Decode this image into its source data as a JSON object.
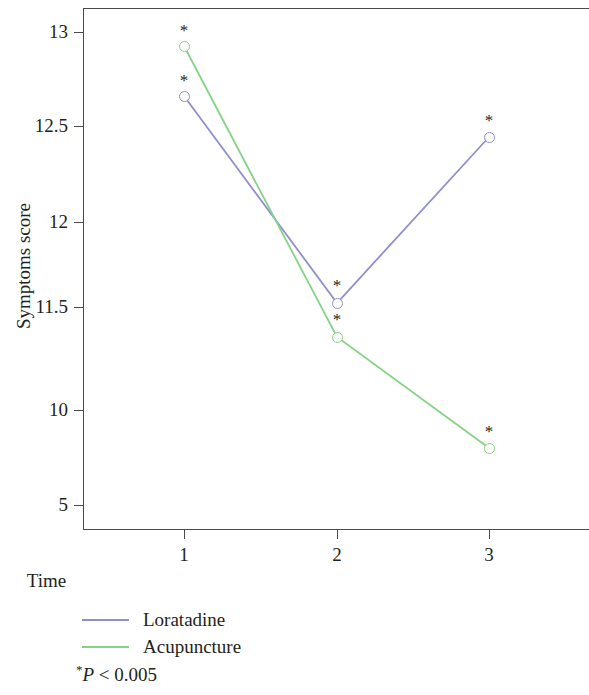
{
  "chart_data": {
    "type": "line",
    "title": "",
    "xlabel": "Time",
    "ylabel": "Symptoms score",
    "x": [
      1,
      2,
      3
    ],
    "categories": [
      "1",
      "2",
      "3"
    ],
    "xtick_labels": [
      "1",
      "2",
      "3"
    ],
    "ytick_labels": [
      "13",
      "12.5",
      "12",
      "11.5",
      "10",
      "5"
    ],
    "ytick_values": [
      13,
      12.5,
      12,
      11.5,
      10,
      5
    ],
    "yaxis_note": "non-uniform tick spacing",
    "grid": false,
    "legend_position": "below-axes-left",
    "series": [
      {
        "name": "Loratadine",
        "color": "#8f8fd0",
        "marker": "open-circle",
        "values": [
          12.67,
          11.55,
          12.45
        ],
        "annotations": [
          "*",
          "*",
          "*"
        ]
      },
      {
        "name": "Acupuncture",
        "color": "#86d386",
        "marker": "open-circle",
        "values": [
          12.93,
          11.4,
          8.8
        ],
        "annotations": [
          "*",
          "*",
          "*"
        ]
      }
    ],
    "annotation_symbol": "*",
    "footnote_symbol": "*",
    "footnote_statistic": "P",
    "footnote_operator": "<",
    "footnote_value": "0.005",
    "footnote_text": "* P < 0.005"
  },
  "axes": {
    "y_ticks": [
      {
        "label": "13",
        "y": 32
      },
      {
        "label": "12.5",
        "y": 126
      },
      {
        "label": "12",
        "y": 222
      },
      {
        "label": "11.5",
        "y": 307
      },
      {
        "label": "10",
        "y": 410
      },
      {
        "label": "5",
        "y": 505
      }
    ],
    "x_ticks": [
      {
        "label": "1",
        "x": 184
      },
      {
        "label": "2",
        "x": 337
      },
      {
        "label": "3",
        "x": 489
      }
    ],
    "x_title": "Time",
    "y_title": "Symptoms score"
  },
  "points": {
    "loratadine": [
      {
        "x": 184,
        "y": 96,
        "star_y": 72
      },
      {
        "x": 337,
        "y": 303,
        "star_y": 277
      },
      {
        "x": 489,
        "y": 137,
        "star_y": 112
      }
    ],
    "acupuncture": [
      {
        "x": 184,
        "y": 46,
        "star_y": 22
      },
      {
        "x": 337,
        "y": 337,
        "star_y": 311
      },
      {
        "x": 489,
        "y": 448,
        "star_y": 423
      }
    ]
  },
  "legend": {
    "items": [
      {
        "label": "Loratadine",
        "color": "#8f8fd0"
      },
      {
        "label": "Acupuncture",
        "color": "#86d386"
      }
    ]
  },
  "footnote": {
    "symbol": "*",
    "statistic": "P",
    "comparison": " < 0.005"
  },
  "colors": {
    "loratadine": "#8f8fd0",
    "acupuncture": "#86d386",
    "axis": "#4a4a4a",
    "text": "#231f20"
  }
}
